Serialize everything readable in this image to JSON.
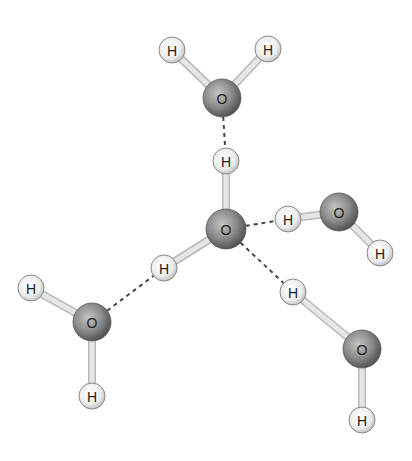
{
  "colors": {
    "background": "#ffffff",
    "oxygen_fill_center": "#b5b5b5",
    "oxygen_fill_edge": "#555555",
    "hydrogen_fill_center": "#f6f6f6",
    "hydrogen_fill_edge": "#bdbdbd",
    "covalent_bond": "#d6d6d6",
    "hydrogen_bond": "#444444"
  },
  "atoms": [
    {
      "id": "o_top",
      "element": "O",
      "label": "O",
      "x": 222,
      "y": 98,
      "r": 19
    },
    {
      "id": "h_top_left",
      "element": "H",
      "label": "H",
      "x": 172,
      "y": 50,
      "r": 13
    },
    {
      "id": "h_top_right",
      "element": "H",
      "label": "H",
      "x": 268,
      "y": 49,
      "r": 13
    },
    {
      "id": "o_center",
      "element": "O",
      "label": "O",
      "x": 226,
      "y": 229,
      "r": 20
    },
    {
      "id": "h_center_up",
      "element": "H",
      "label": "H",
      "x": 226,
      "y": 161,
      "r": 13
    },
    {
      "id": "h_center_left",
      "element": "H",
      "label": "H",
      "x": 164,
      "y": 268,
      "r": 13
    },
    {
      "id": "o_right",
      "element": "O",
      "label": "O",
      "x": 339,
      "y": 212,
      "r": 19
    },
    {
      "id": "h_right_donor",
      "element": "H",
      "label": "H",
      "x": 288,
      "y": 219,
      "r": 13
    },
    {
      "id": "h_right_lower",
      "element": "H",
      "label": "H",
      "x": 380,
      "y": 253,
      "r": 13
    },
    {
      "id": "o_left",
      "element": "O",
      "label": "O",
      "x": 92,
      "y": 322,
      "r": 19
    },
    {
      "id": "h_left_upper",
      "element": "H",
      "label": "H",
      "x": 31,
      "y": 288,
      "r": 13
    },
    {
      "id": "h_left_lower",
      "element": "H",
      "label": "H",
      "x": 92,
      "y": 396,
      "r": 13
    },
    {
      "id": "o_lower_right",
      "element": "O",
      "label": "O",
      "x": 362,
      "y": 349,
      "r": 19
    },
    {
      "id": "h_lower_right_donor",
      "element": "H",
      "label": "H",
      "x": 293,
      "y": 292,
      "r": 13
    },
    {
      "id": "h_lower_right_bottom",
      "element": "H",
      "label": "H",
      "x": 362,
      "y": 420,
      "r": 13
    }
  ],
  "covalent_bonds": [
    {
      "from": "o_top",
      "to": "h_top_left"
    },
    {
      "from": "o_top",
      "to": "h_top_right"
    },
    {
      "from": "o_center",
      "to": "h_center_up"
    },
    {
      "from": "o_center",
      "to": "h_center_left"
    },
    {
      "from": "o_right",
      "to": "h_right_donor"
    },
    {
      "from": "o_right",
      "to": "h_right_lower"
    },
    {
      "from": "o_left",
      "to": "h_left_upper"
    },
    {
      "from": "o_left",
      "to": "h_left_lower"
    },
    {
      "from": "o_lower_right",
      "to": "h_lower_right_donor"
    },
    {
      "from": "o_lower_right",
      "to": "h_lower_right_bottom"
    }
  ],
  "hydrogen_bonds": [
    {
      "from": "o_top",
      "to": "h_center_up"
    },
    {
      "from": "o_center",
      "to": "h_right_donor"
    },
    {
      "from": "o_center",
      "to": "h_lower_right_donor"
    },
    {
      "from": "o_left",
      "to": "h_center_left"
    }
  ]
}
